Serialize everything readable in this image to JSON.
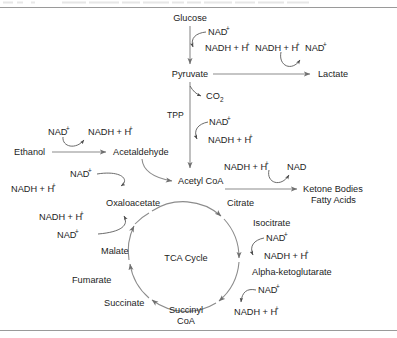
{
  "figure": {
    "top_rule": true,
    "bottom_rule": true,
    "header_fragment": ""
  },
  "metabolites": {
    "glucose": "Glucose",
    "pyruvate": "Pyruvate",
    "lactate": "Lactate",
    "ethanol": "Ethanol",
    "acetaldehyde": "Acetaldehyde",
    "acetyl_coa": "Acetyl CoA",
    "oxaloacetate": "Oxaloacetate",
    "malate": "Malate",
    "fumarate": "Fumarate",
    "succinate": "Succinate",
    "succinyl_coa_line1": "Succinyl",
    "succinyl_coa_line2": "CoA",
    "alpha_ketoglutarate": "Alpha-ketoglutarate",
    "isocitrate": "Isocitrate",
    "citrate": "Citrate",
    "ketone_bodies": "Ketone Bodies",
    "fatty_acids": "Fatty Acids",
    "co2": "CO",
    "co2_sub": "2",
    "cycle_center": "TCA Cycle"
  },
  "cofactors": {
    "nad_plus": "NAD",
    "nad_plus_sup": "+",
    "nadh": "NADH + H",
    "nadh_sup": "+",
    "nad_no_charge": "NAD",
    "tpp": "TPP"
  },
  "cofactor_pairs": [
    {
      "id": "glycolysis",
      "reactant": "NAD+",
      "product": "NADH + H+",
      "reaction": "Glucose to Pyruvate"
    },
    {
      "id": "lactate",
      "reactant": "NADH + H+",
      "product": "NAD+",
      "reaction": "Pyruvate to Lactate"
    },
    {
      "id": "pdh",
      "reactant": "NAD+",
      "product": "NADH + H+",
      "reaction": "Pyruvate to Acetyl CoA"
    },
    {
      "id": "adh",
      "reactant": "NAD+",
      "product": "NADH + H+",
      "reaction": "Ethanol to Acetaldehyde"
    },
    {
      "id": "aldh",
      "reactant": "NAD+",
      "product": "NADH + H+",
      "reaction": "Acetaldehyde to Acetyl CoA"
    },
    {
      "id": "ketogenesis",
      "reactant": "NADH + H+",
      "product": "NAD",
      "reaction": "Acetyl CoA to Ketone Bodies / Fatty Acids"
    },
    {
      "id": "mdh",
      "reactant": "NAD+",
      "product": "NADH + H+",
      "reaction": "Malate to Oxaloacetate"
    },
    {
      "id": "idh",
      "reactant": "NAD+",
      "product": "NADH + H+",
      "reaction": "Isocitrate to Alpha-ketoglutarate"
    },
    {
      "id": "kgdh",
      "reactant": "NAD+",
      "product": "NADH + H+",
      "reaction": "Alpha-ketoglutarate to Succinyl CoA"
    }
  ],
  "cofactor_labels": {
    "glycolysis_reactant": "NAD",
    "glycolysis_product": "NADH + H",
    "lactate_reactant": "NADH + H",
    "lactate_product": "NAD",
    "pdh_reactant": "NAD",
    "pdh_product": "NADH + H",
    "adh_reactant": "NAD",
    "adh_product": "NADH + H",
    "aldh_reactant": "NAD",
    "aldh_product": "NADH + H",
    "keto_reactant": "NADH + H",
    "keto_product": "NAD",
    "mdh_reactant": "NAD",
    "mdh_product": "NADH + H",
    "idh_reactant": "NAD",
    "idh_product": "NADH + H",
    "kgdh_reactant": "NAD",
    "kgdh_product": "NADH + H"
  },
  "cycle": {
    "center_label": "TCA Cycle",
    "direction": "clockwise",
    "members": [
      "Citrate",
      "Isocitrate",
      "Alpha-ketoglutarate",
      "Succinyl CoA",
      "Succinate",
      "Fumarate",
      "Malate",
      "Oxaloacetate"
    ]
  },
  "colors": {
    "line": "#8c8c8c",
    "thin_line": "#5a5a5a",
    "text": "#1c1c1c",
    "rule": "#9a9a9a",
    "background": "#ffffff"
  }
}
